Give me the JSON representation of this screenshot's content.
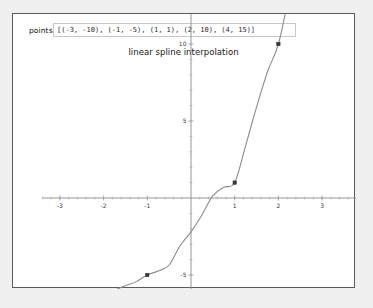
{
  "window": {
    "title": "linear spline interpolation"
  },
  "controls": {
    "points_label": "points",
    "points_value": "[(-3, -10), (-1, -5), (1, 1), (2, 10), (4, 15)]",
    "points_placeholder": "[(x, y), ...]"
  },
  "chart_data": {
    "type": "line",
    "title": "linear spline interpolation",
    "xlabel": "",
    "ylabel": "",
    "xlim": [
      -3.4,
      4.3
    ],
    "ylim": [
      -11.5,
      20.5
    ],
    "grid": false,
    "legend": null,
    "x_ticks": [
      -3,
      -2,
      -1,
      1,
      2,
      3,
      4
    ],
    "x_tick_labels": [
      "-3",
      "-2",
      "-1",
      "1",
      "2",
      "3",
      "4"
    ],
    "y_ticks": [
      15,
      10,
      5,
      -5,
      -10
    ],
    "y_tick_labels": [
      "15",
      "10",
      "5",
      "-5",
      "-10"
    ],
    "x_minor_step": 0.2,
    "y_minor_step": 1,
    "series": [
      {
        "name": "spline",
        "type": "line",
        "color": "#8b8b9a",
        "x": [
          -3,
          -2.75,
          -2.5,
          -2.25,
          -2,
          -1.75,
          -1.5,
          -1.25,
          -1,
          -0.75,
          -0.5,
          -0.25,
          0,
          0.25,
          0.5,
          0.75,
          1,
          1.25,
          1.5,
          1.75,
          2,
          2.25,
          2.5,
          2.75,
          3,
          3.25,
          3.5,
          3.75,
          4
        ],
        "y": [
          -10,
          -8.72,
          -7.72,
          -6.96,
          -6.4,
          -6.0,
          -5.7,
          -5.43,
          -5,
          -4.74,
          -4.35,
          -3.1,
          -2.2,
          -1.1,
          0.15,
          0.7,
          1,
          3.4,
          5.9,
          8.2,
          10,
          13.2,
          15.9,
          17.9,
          18.9,
          19.1,
          18.6,
          17.2,
          15
        ]
      },
      {
        "name": "control points",
        "type": "scatter",
        "color": "#3a3a3a",
        "points": [
          {
            "x": -3,
            "y": -10
          },
          {
            "x": -1,
            "y": -5
          },
          {
            "x": 1,
            "y": 1
          },
          {
            "x": 2,
            "y": 10
          },
          {
            "x": 4,
            "y": 15
          }
        ]
      }
    ]
  },
  "colors": {
    "window_border": "#5a5a5a",
    "page_background": "#f0f0f0",
    "plot_background": "#ffffff",
    "axis": "#8a8a8a",
    "curve": "#8b8b9a",
    "marker": "#3a3a3a"
  }
}
